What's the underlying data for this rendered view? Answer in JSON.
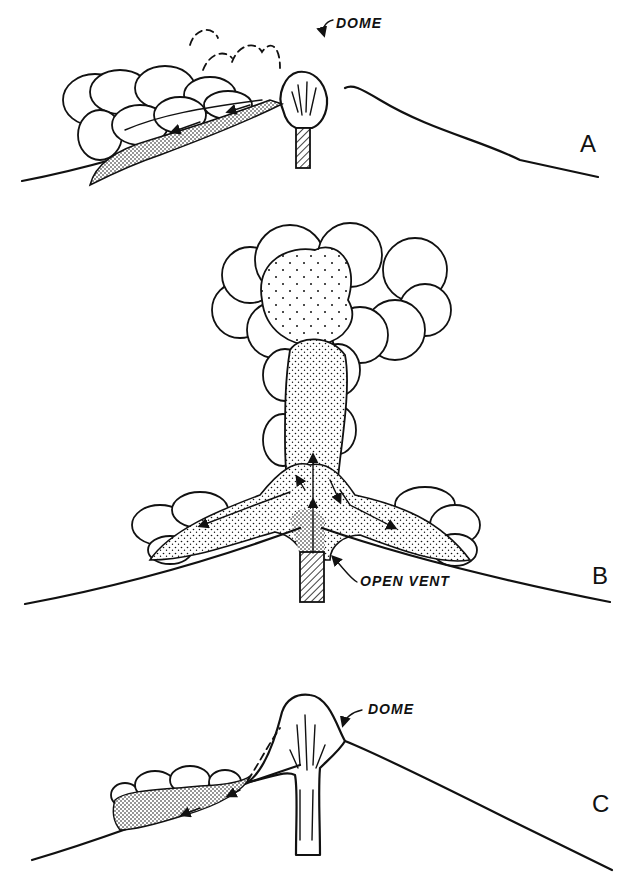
{
  "figure": {
    "panels": [
      {
        "id": "A",
        "letter": "A",
        "annotation": "DOME"
      },
      {
        "id": "B",
        "letter": "B",
        "annotation": "OPEN VENT"
      },
      {
        "id": "C",
        "letter": "C",
        "annotation": "DOME"
      }
    ]
  }
}
